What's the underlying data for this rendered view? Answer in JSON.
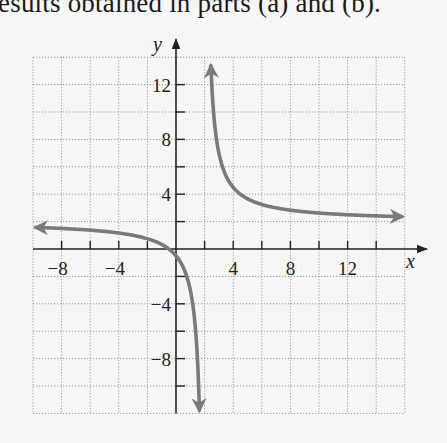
{
  "header_text": "esults obtained in parts (a) and (b).",
  "chart_data": {
    "type": "line",
    "title": "",
    "function": "y = (2x + 1) / (x - 2)",
    "xlabel": "x",
    "ylabel": "y",
    "xlim": [
      -10,
      16
    ],
    "ylim": [
      -12,
      14
    ],
    "grid": true,
    "grid_step": 2,
    "x_ticks": [
      -8,
      -4,
      4,
      8,
      12
    ],
    "y_ticks": [
      12,
      8,
      4,
      -4,
      -8
    ],
    "x_tick_labels": [
      "−8",
      "−4",
      "4",
      "8",
      "12"
    ],
    "y_tick_labels": [
      "12",
      "8",
      "4",
      "−4",
      "−8"
    ],
    "asymptotes": {
      "vertical": 2,
      "horizontal": 2
    },
    "series": [
      {
        "name": "left branch",
        "x": [
          -9.8,
          -8,
          -6,
          -4,
          -2,
          -1,
          0,
          0.5,
          1,
          1.3,
          1.5,
          1.7,
          1.8
        ],
        "values": [
          1.59,
          1.5,
          1.38,
          1.17,
          0.75,
          0.33,
          -0.5,
          -1.33,
          -3.0,
          -5.14,
          -8.0,
          -14.67,
          -23.0
        ]
      },
      {
        "name": "right branch",
        "x": [
          2.35,
          2.5,
          3,
          4,
          5,
          6,
          8,
          10,
          12,
          14,
          15.7
        ],
        "values": [
          16.3,
          12.0,
          7.0,
          4.5,
          3.67,
          3.25,
          2.83,
          2.63,
          2.5,
          2.42,
          2.36
        ]
      }
    ],
    "curve_color": "#7a7a7a"
  }
}
